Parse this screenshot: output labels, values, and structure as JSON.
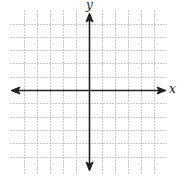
{
  "diagram": {
    "type": "coordinate-plane",
    "axes": {
      "x_label": "x",
      "y_label": "y"
    },
    "grid": {
      "columns_left_of_y_axis": 6,
      "columns_right_of_y_axis": 6,
      "rows_above_x_axis": 6,
      "rows_below_x_axis": 6,
      "line_style": "dashed-light",
      "grid_color": "#c8c8c8",
      "axis_color": "#222222"
    }
  }
}
